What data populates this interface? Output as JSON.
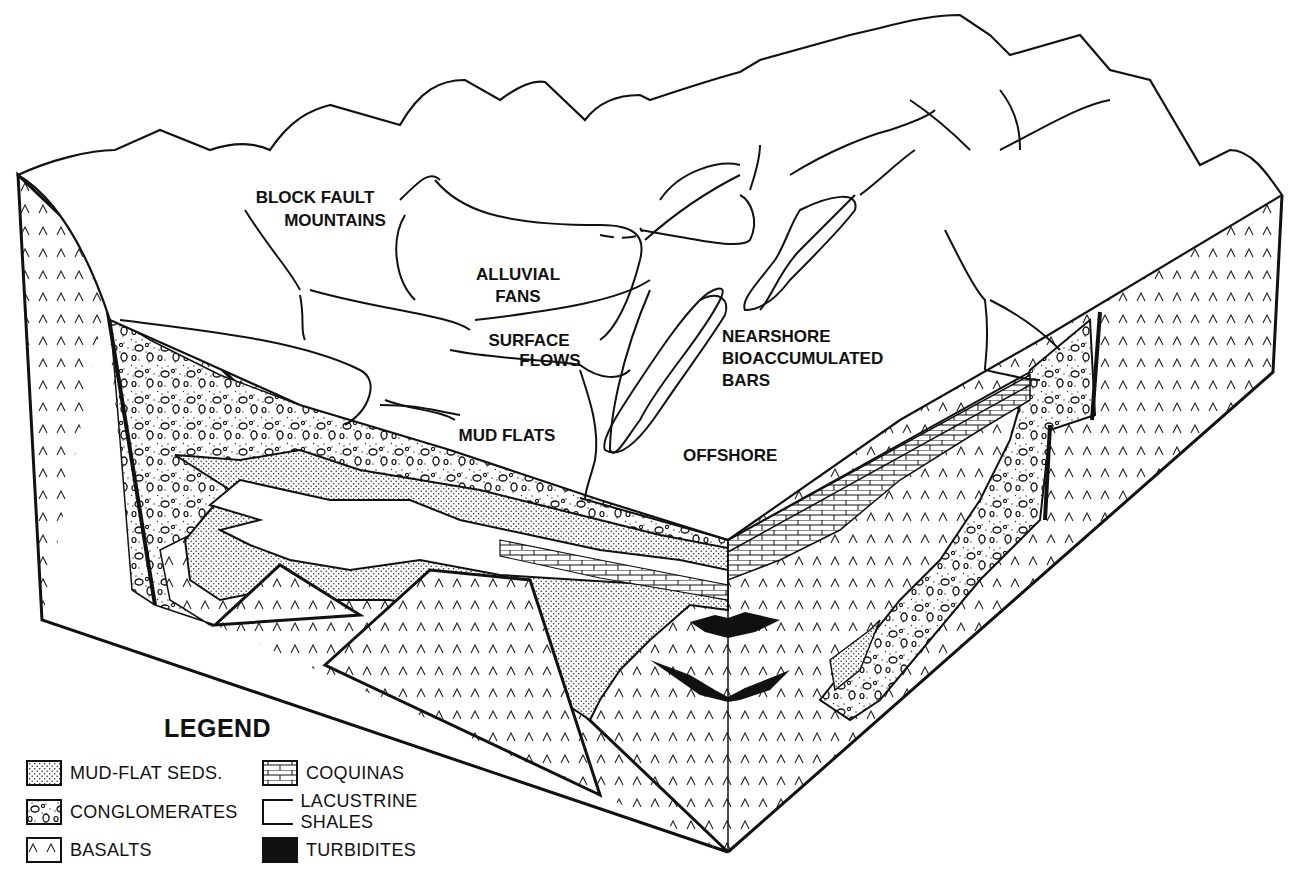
{
  "diagram": {
    "type": "geological block diagram",
    "surface_labels": {
      "block_fault_mountains": [
        "BLOCK FAULT",
        "MOUNTAINS"
      ],
      "alluvial_fans": [
        "ALLUVIAL",
        "FANS"
      ],
      "surface_flows": [
        "SURFACE",
        "FLOWS"
      ],
      "mud_flats": "MUD FLATS",
      "nearshore": [
        "NEARSHORE",
        "BIOACCUMULATED",
        "BARS"
      ],
      "offshore": "OFFSHORE"
    }
  },
  "legend": {
    "title": "LEGEND",
    "items": [
      {
        "key": "mud-flat",
        "label": "MUD-FLAT SEDS.",
        "pattern": "stipple"
      },
      {
        "key": "conglomerates",
        "label": "CONGLOMERATES",
        "pattern": "pebbles"
      },
      {
        "key": "basalts",
        "label": "BASALTS",
        "pattern": "carets"
      },
      {
        "key": "coquinas",
        "label": "COQUINAS",
        "pattern": "brick"
      },
      {
        "key": "lacustrine",
        "label": "LACUSTRINE SHALES",
        "pattern": "blank"
      },
      {
        "key": "turbidites",
        "label": "TURBIDITES",
        "pattern": "solid"
      }
    ]
  },
  "colors": {
    "ink": "#111111",
    "paper": "#ffffff"
  }
}
